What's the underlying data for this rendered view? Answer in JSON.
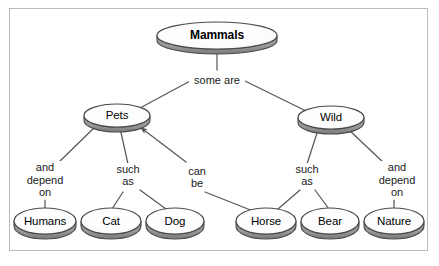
{
  "diagram": {
    "type": "concept-map",
    "title_node": "Mammals",
    "colors": {
      "background": "#ffffff",
      "frame_border": "#b9b9b9",
      "node_fill": "#ffffff",
      "node_stroke": "#4a4a4a",
      "node_side_shadow": "#8a8a8a",
      "edge_stroke": "#585858",
      "text": "#000000"
    },
    "nodes": [
      {
        "id": "mammals",
        "label": "Mammals",
        "bold": true,
        "cx": 217,
        "cy": 35,
        "rx": 60,
        "ry": 13.5,
        "depth": 5,
        "font_size": 12
      },
      {
        "id": "pets",
        "label": "Pets",
        "bold": false,
        "cx": 117,
        "cy": 115,
        "rx": 33,
        "ry": 11.5,
        "depth": 5,
        "font_size": 11.5
      },
      {
        "id": "wild",
        "label": "Wild",
        "bold": false,
        "cx": 331,
        "cy": 117,
        "rx": 33,
        "ry": 11.5,
        "depth": 5,
        "font_size": 11.5
      },
      {
        "id": "humans",
        "label": "Humans",
        "bold": false,
        "cx": 45,
        "cy": 221,
        "rx": 31,
        "ry": 13,
        "depth": 5,
        "font_size": 11.5
      },
      {
        "id": "cat",
        "label": "Cat",
        "bold": false,
        "cx": 111,
        "cy": 221,
        "rx": 30,
        "ry": 13,
        "depth": 5,
        "font_size": 11.5
      },
      {
        "id": "dog",
        "label": "Dog",
        "bold": false,
        "cx": 175,
        "cy": 221,
        "rx": 29,
        "ry": 13,
        "depth": 5,
        "font_size": 11.5
      },
      {
        "id": "horse",
        "label": "Horse",
        "bold": false,
        "cx": 266,
        "cy": 221,
        "rx": 30,
        "ry": 13,
        "depth": 5,
        "font_size": 11.5
      },
      {
        "id": "bear",
        "label": "Bear",
        "bold": false,
        "cx": 330,
        "cy": 221,
        "rx": 29,
        "ry": 13,
        "depth": 5,
        "font_size": 11.5
      },
      {
        "id": "nature",
        "label": "Nature",
        "bold": false,
        "cx": 394,
        "cy": 221,
        "rx": 30,
        "ry": 13,
        "depth": 5,
        "font_size": 11.5
      }
    ],
    "link_labels": [
      {
        "id": "some-are",
        "text": "some are",
        "cx": 217,
        "cy": 80,
        "width": 56
      },
      {
        "id": "and-depend-on-left",
        "text": "and\ndepend\non",
        "cx": 45,
        "cy": 180,
        "width": 54
      },
      {
        "id": "such-as-left",
        "text": "such\nas",
        "cx": 128,
        "cy": 175,
        "width": 40
      },
      {
        "id": "can-be",
        "text": "can\nbe",
        "cx": 197,
        "cy": 177,
        "width": 36
      },
      {
        "id": "such-as-right",
        "text": "such\nas",
        "cx": 307,
        "cy": 175,
        "width": 40
      },
      {
        "id": "and-depend-on-right",
        "text": "and\ndepend\non",
        "cx": 397,
        "cy": 180,
        "width": 54
      }
    ],
    "edges": [
      {
        "id": "mammals-to-some-are",
        "from": "mammals",
        "to": "some-are",
        "x1": 217,
        "y1": 49,
        "x2": 217,
        "y2": 70,
        "arrow": false
      },
      {
        "id": "some-are-to-pets",
        "from": "some-are",
        "to": "pets",
        "x1": 192,
        "y1": 80,
        "x2": 140,
        "y2": 108,
        "arrow": false
      },
      {
        "id": "some-are-to-wild",
        "from": "some-are",
        "to": "wild",
        "x1": 243,
        "y1": 80,
        "x2": 306,
        "y2": 111,
        "arrow": false
      },
      {
        "id": "pets-to-and-depend",
        "from": "pets",
        "to": "and-depend-on-left",
        "x1": 96,
        "y1": 126,
        "x2": 57,
        "y2": 164,
        "arrow": false
      },
      {
        "id": "pets-to-such-as",
        "from": "pets",
        "to": "such-as-left",
        "x1": 120,
        "y1": 128,
        "x2": 128,
        "y2": 164,
        "arrow": false
      },
      {
        "id": "can-be-to-pets",
        "from": "can-be",
        "to": "pets",
        "x1": 186,
        "y1": 162,
        "x2": 140,
        "y2": 127,
        "arrow": true
      },
      {
        "id": "and-depend-to-humans",
        "from": "and-depend-on-left",
        "to": "humans",
        "x1": 45,
        "y1": 200,
        "x2": 45,
        "y2": 209,
        "arrow": false
      },
      {
        "id": "such-as-to-cat",
        "from": "such-as-left",
        "to": "cat",
        "x1": 123,
        "y1": 192,
        "x2": 112,
        "y2": 209,
        "arrow": false
      },
      {
        "id": "such-as-to-dog",
        "from": "such-as-left",
        "to": "dog",
        "x1": 140,
        "y1": 190,
        "x2": 166,
        "y2": 209,
        "arrow": false
      },
      {
        "id": "can-be-to-horse",
        "from": "can-be",
        "to": "horse",
        "x1": 205,
        "y1": 192,
        "x2": 253,
        "y2": 211,
        "arrow": false
      },
      {
        "id": "wild-to-such-as",
        "from": "wild",
        "to": "such-as-right",
        "x1": 318,
        "y1": 130,
        "x2": 307,
        "y2": 164,
        "arrow": false
      },
      {
        "id": "wild-to-and-depend",
        "from": "wild",
        "to": "and-depend-on-right",
        "x1": 348,
        "y1": 129,
        "x2": 385,
        "y2": 164,
        "arrow": false
      },
      {
        "id": "such-as-to-horse",
        "from": "such-as-right",
        "to": "horse",
        "x1": 300,
        "y1": 190,
        "x2": 278,
        "y2": 209,
        "arrow": false
      },
      {
        "id": "such-as-to-bear",
        "from": "such-as-right",
        "to": "bear",
        "x1": 315,
        "y1": 190,
        "x2": 329,
        "y2": 209,
        "arrow": false
      },
      {
        "id": "and-depend-to-nature",
        "from": "and-depend-on-right",
        "to": "nature",
        "x1": 394,
        "y1": 200,
        "x2": 394,
        "y2": 209,
        "arrow": false
      }
    ]
  }
}
